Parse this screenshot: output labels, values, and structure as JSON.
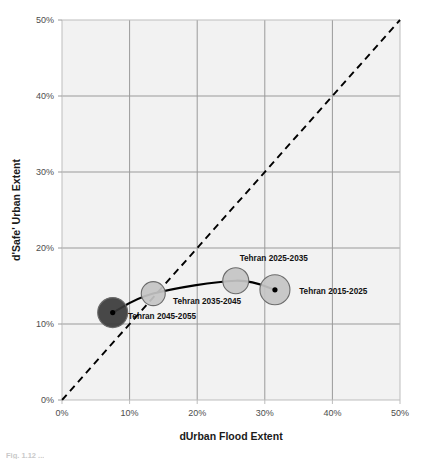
{
  "chart_data": {
    "type": "scatter",
    "title": "",
    "xlabel": "dUrban Flood Extent",
    "ylabel": "d'Safe' Urban Extent",
    "xlim": [
      0,
      50
    ],
    "ylim": [
      0,
      50
    ],
    "xticks": [
      "0%",
      "10%",
      "20%",
      "30%",
      "40%",
      "50%"
    ],
    "xtick_values": [
      0,
      10,
      20,
      30,
      40,
      50
    ],
    "yticks": [
      "0%",
      "10%",
      "20%",
      "30%",
      "40%",
      "50%"
    ],
    "ytick_values": [
      0,
      10,
      20,
      30,
      40,
      50
    ],
    "grid": true,
    "legend_position": "none",
    "annotations": [
      {
        "text": "1:1 reference line",
        "style": "dashed-diagonal"
      }
    ],
    "series": [
      {
        "name": "Tehran decadal trajectory",
        "connector": "smooth-curve",
        "points": [
          {
            "label": "Tehran 2045-2055",
            "x": 7.5,
            "y": 11.5,
            "bubble_radius_px": 15,
            "fill": "#3a3a3a",
            "label_dx": 13,
            "label_dy": 6
          },
          {
            "label": "Tehran 2035-2045",
            "x": 13.5,
            "y": 14.0,
            "bubble_radius_px": 12,
            "fill": "#c4c4c4",
            "label_dx": 18,
            "label_dy": 10
          },
          {
            "label": "Tehran 2025-2035",
            "x": 25.7,
            "y": 15.7,
            "bubble_radius_px": 13,
            "fill": "#c4c4c4",
            "label_dx": 2,
            "label_dy": -20
          },
          {
            "label": "Tehran 2015-2025",
            "x": 31.5,
            "y": 14.5,
            "bubble_radius_px": 15,
            "fill": "#c4c4c4",
            "label_dx": 22,
            "label_dy": 4
          }
        ]
      }
    ]
  },
  "colors": {
    "plot_background": "#f2f2f2",
    "gridline": "#9a9a9a",
    "axis_line": "#bdbdbd",
    "bubble_fill_light": "#c4c4c4",
    "bubble_fill_dark": "#3a3a3a",
    "bubble_stroke": "#6b6b6b",
    "curve": "#000000",
    "reference_line": "#000000",
    "tick_text": "#4d4d4d",
    "title_text": "#1a1a1a"
  },
  "caption": {
    "text": "Fig. 1.12  ..."
  }
}
